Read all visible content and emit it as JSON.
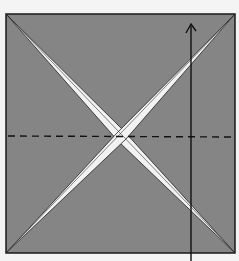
{
  "diagram": {
    "type": "origami-fold-step",
    "paper": {
      "x": 6,
      "y": 14,
      "size": 229,
      "fill": "#858585",
      "stroke": "#1a1a1a"
    },
    "creases": [
      {
        "name": "diagonal-tl-br",
        "from": [
          6,
          14
        ],
        "to": [
          235,
          253
        ]
      },
      {
        "name": "diagonal-tr-bl",
        "from": [
          235,
          14
        ],
        "to": [
          6,
          253
        ]
      }
    ],
    "valley_fold_line": {
      "y": 136,
      "style": "dashed"
    },
    "fold_arrow": {
      "x": 191,
      "y_start": 261,
      "y_end": 24,
      "direction": "up"
    },
    "colors": {
      "paper": "#858585",
      "crease_highlight": "#f2f2f2",
      "ink": "#111111",
      "background": "#f4f4f4"
    }
  }
}
